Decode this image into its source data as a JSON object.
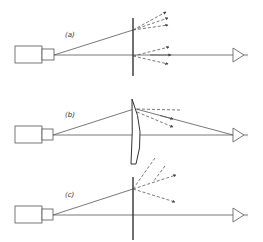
{
  "diagram": {
    "type": "optical-ray-diagram",
    "panels": [
      {
        "id": "a",
        "label": "(a)",
        "element": "flat plate (hologram)",
        "axis_y": 55,
        "label_pos": [
          65,
          37
        ]
      },
      {
        "id": "b",
        "label": "(b)",
        "element": "curved lens/plate",
        "axis_y": 135,
        "label_pos": [
          65,
          117
        ]
      },
      {
        "id": "c",
        "label": "(c)",
        "element": "flat plate",
        "axis_y": 215,
        "label_pos": [
          65,
          197
        ]
      }
    ],
    "components": {
      "source": "camera/projector",
      "observer": "eye"
    },
    "colors": {
      "line": "#555555",
      "plate": "#333333",
      "background": "#ffffff"
    }
  }
}
